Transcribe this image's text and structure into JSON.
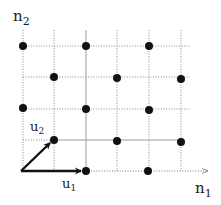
{
  "diagram": {
    "axes": {
      "x_label": "n",
      "x_subscript": "1",
      "y_label": "n",
      "y_subscript": "2"
    },
    "vectors": [
      {
        "name": "u",
        "subscript": "1",
        "from": [
          0,
          0
        ],
        "to": [
          2,
          0
        ]
      },
      {
        "name": "u",
        "subscript": "2",
        "from": [
          0,
          0
        ],
        "to": [
          1,
          1
        ]
      }
    ],
    "grid": {
      "columns": 6,
      "rows": 5
    },
    "lattice_points": [
      [
        0,
        4
      ],
      [
        2,
        4
      ],
      [
        4,
        4
      ],
      [
        1,
        3
      ],
      [
        3,
        3
      ],
      [
        5,
        3
      ],
      [
        0,
        2
      ],
      [
        2,
        2
      ],
      [
        4,
        2
      ],
      [
        1,
        1
      ],
      [
        3,
        1
      ],
      [
        5,
        1
      ],
      [
        2,
        0
      ],
      [
        4,
        0
      ]
    ],
    "colors": {
      "points": "#111111",
      "vectors": "#111111",
      "grid": "#8a8a8a",
      "solid_grid": "#9a9a9a"
    }
  }
}
